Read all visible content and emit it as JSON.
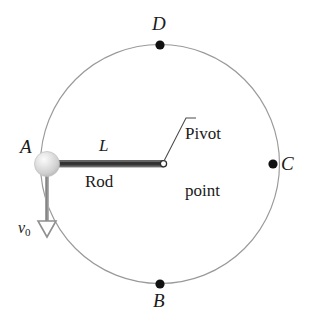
{
  "figure": {
    "colors": {
      "circle_stroke": "#9a9a9a",
      "rod_dark": "#3b3b3b",
      "rod_light": "#8f8f8f",
      "ball_fill": "#d8d8d8",
      "ball_highlight": "#f2f2f2",
      "point_dot": "#111111",
      "leader_line": "#4a4a4a",
      "arrow_color": "#8a8a8a",
      "text": "#1a1a1a",
      "background": "#ffffff"
    },
    "points": [
      {
        "id": "A",
        "label": "A",
        "cx": 47,
        "cy": 164,
        "kind": "ball",
        "label_x": 21,
        "label_y": 138
      },
      {
        "id": "B",
        "label": "B",
        "cx": 160,
        "cy": 284,
        "kind": "dot",
        "label_x": 153,
        "label_y": 291
      },
      {
        "id": "C",
        "label": "C",
        "cx": 273,
        "cy": 164,
        "kind": "dot",
        "label_x": 281,
        "label_y": 155
      },
      {
        "id": "D",
        "label": "D",
        "cx": 160,
        "cy": 45,
        "kind": "dot",
        "label_x": 152,
        "label_y": 16
      }
    ],
    "circle": {
      "cx": 160,
      "cy": 164,
      "r": 119.5
    },
    "rod": {
      "label_length": "L",
      "label_name": "Rod",
      "x1": 47,
      "y1": 164,
      "x2": 163,
      "y2": 164,
      "length_label_x": 99,
      "length_label_y": 139,
      "name_label_x": 85,
      "name_label_y": 172
    },
    "pivot": {
      "label_line1": "Pivot",
      "label_line2": "point",
      "cx": 163,
      "cy": 164,
      "label_x": 184,
      "label_y": 89,
      "leader": "M163,163 L186,118 L196,118"
    },
    "velocity": {
      "label": "v",
      "subscript": "0",
      "label_x": 19,
      "label_y": 222,
      "tail_x": 47,
      "tail_y": 174,
      "head_x": 47,
      "head_y": 235
    }
  }
}
